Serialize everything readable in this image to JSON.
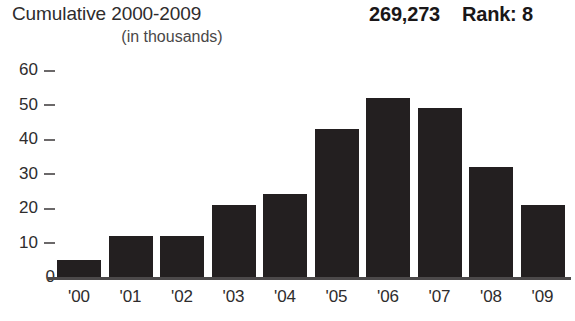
{
  "header": {
    "title": "Cumulative 2000-2009",
    "subtitle": "(in thousands)",
    "total": "269,273",
    "rank": "Rank: 8"
  },
  "chart_data": {
    "type": "bar",
    "title": "Cumulative 2000-2009",
    "subtitle": "(in thousands)",
    "xlabel": "",
    "ylabel": "",
    "categories": [
      "'00",
      "'01",
      "'02",
      "'03",
      "'04",
      "'05",
      "'06",
      "'07",
      "'08",
      "'09"
    ],
    "values": [
      5,
      12,
      12,
      21,
      24,
      43,
      52,
      49,
      32,
      21
    ],
    "ylim": [
      0,
      60
    ],
    "yticks": [
      0,
      10,
      20,
      30,
      40,
      50,
      60
    ],
    "ytick_labels": [
      "0",
      "10",
      "20",
      "30",
      "40",
      "50",
      "60"
    ],
    "grid": false,
    "legend": null,
    "annotations": {
      "total": "269,273",
      "rank": "Rank: 8"
    },
    "bar_color": "#231f20",
    "axis_color": "#4c494a",
    "text_color": "#2e2c2d"
  }
}
